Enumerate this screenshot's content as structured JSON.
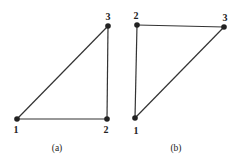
{
  "diagrams": [
    {
      "caption": "(a)",
      "nodes": [
        {
          "label": "1",
          "x": 17,
          "y": 119,
          "lx": 16,
          "ly": 133
        },
        {
          "label": "2",
          "x": 107,
          "y": 119,
          "lx": 106,
          "ly": 133
        },
        {
          "label": "3",
          "x": 108,
          "y": 26,
          "lx": 108,
          "ly": 20
        }
      ],
      "edges": [
        [
          0,
          1
        ],
        [
          1,
          2
        ],
        [
          2,
          0
        ]
      ],
      "caption_pos": {
        "x": 57,
        "y": 151
      }
    },
    {
      "caption": "(b)",
      "nodes": [
        {
          "label": "1",
          "x": 135,
          "y": 118,
          "lx": 136,
          "ly": 134
        },
        {
          "label": "2",
          "x": 137,
          "y": 25,
          "lx": 136,
          "ly": 19
        },
        {
          "label": "3",
          "x": 224,
          "y": 27,
          "lx": 225,
          "ly": 21
        }
      ],
      "edges": [
        [
          0,
          1
        ],
        [
          1,
          2
        ],
        [
          2,
          0
        ]
      ],
      "caption_pos": {
        "x": 176,
        "y": 151
      }
    }
  ],
  "colors": {
    "line": "#333333",
    "node": "#222222"
  }
}
